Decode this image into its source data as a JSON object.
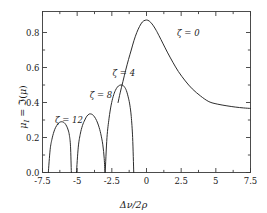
{
  "chart_data": {
    "type": "line",
    "title": "",
    "xlabel": "Δν/2ρ",
    "ylabel": "μ_I = ℑ(μ)",
    "xlim": [
      -7.5,
      7.5
    ],
    "ylim": [
      0.0,
      0.92
    ],
    "grid": false,
    "legend_position": "inline-annotations",
    "xticks": [
      "-7.5",
      "-5",
      "-2.5",
      "0",
      "2.5",
      "5",
      "7.5"
    ],
    "xtick_values": [
      -7.5,
      -5,
      -2.5,
      0,
      2.5,
      5,
      7.5
    ],
    "yticks": [
      "0.0",
      "0.2",
      "0.4",
      "0.6",
      "0.8"
    ],
    "ytick_values": [
      0.0,
      0.2,
      0.4,
      0.6,
      0.8
    ],
    "minor_xtick_values": [
      -6.25,
      -3.75,
      -1.25,
      1.25,
      3.75,
      6.25
    ],
    "minor_ytick_values": [
      0.1,
      0.3,
      0.5,
      0.7
    ],
    "series": [
      {
        "name": "ζ = 0",
        "label": "ζ = 0",
        "label_x": 2.2,
        "label_y": 0.79,
        "peak_x": 0.1,
        "peak_y": 0.87,
        "x": [
          -2.05,
          -1.9,
          -1.7,
          -1.5,
          -1.3,
          -1.1,
          -0.9,
          -0.7,
          -0.5,
          -0.3,
          -0.1,
          0.1,
          0.3,
          0.5,
          0.7,
          0.9,
          1.2,
          1.5,
          1.9,
          2.3,
          2.8,
          3.3,
          3.9,
          4.5,
          5.1,
          5.8,
          6.4,
          7.0,
          7.5
        ],
        "y": [
          0.4,
          0.455,
          0.52,
          0.585,
          0.645,
          0.7,
          0.755,
          0.8,
          0.835,
          0.86,
          0.87,
          0.87,
          0.858,
          0.838,
          0.812,
          0.782,
          0.735,
          0.688,
          0.63,
          0.577,
          0.523,
          0.478,
          0.437,
          0.405,
          0.391,
          0.381,
          0.374,
          0.369,
          0.366
        ]
      },
      {
        "name": "ζ = 4",
        "label": "ζ = 4",
        "label_x": -2.45,
        "label_y": 0.565,
        "peak_x": -1.75,
        "peak_y": 0.5,
        "zero_left": -2.98,
        "zero_right": -0.92,
        "x": [
          -2.98,
          -2.85,
          -2.7,
          -2.55,
          -2.4,
          -2.25,
          -2.1,
          -1.95,
          -1.75,
          -1.6,
          -1.45,
          -1.3,
          -1.2,
          -1.1,
          -1.0,
          -0.92
        ],
        "y": [
          0.0,
          0.2,
          0.31,
          0.385,
          0.435,
          0.468,
          0.488,
          0.498,
          0.5,
          0.49,
          0.468,
          0.425,
          0.385,
          0.32,
          0.2,
          0.0
        ]
      },
      {
        "name": "ζ = 8",
        "label": "ζ = 8",
        "label_x": -4.1,
        "label_y": 0.435,
        "peak_x": -4.05,
        "peak_y": 0.335,
        "zero_left": -5.05,
        "zero_right": -3.0,
        "x": [
          -5.05,
          -4.92,
          -4.78,
          -4.62,
          -4.45,
          -4.3,
          -4.15,
          -4.05,
          -3.9,
          -3.75,
          -3.6,
          -3.45,
          -3.3,
          -3.15,
          -3.05,
          -3.0
        ],
        "y": [
          0.0,
          0.145,
          0.218,
          0.268,
          0.3,
          0.322,
          0.333,
          0.335,
          0.331,
          0.318,
          0.297,
          0.266,
          0.222,
          0.158,
          0.08,
          0.0
        ]
      },
      {
        "name": "ζ = 12",
        "label": "ζ = 12",
        "label_x": -6.6,
        "label_y": 0.295,
        "peak_x": -6.15,
        "peak_y": 0.29,
        "zero_left": -7.08,
        "zero_right": -5.42,
        "x": [
          -7.08,
          -6.95,
          -6.82,
          -6.68,
          -6.55,
          -6.4,
          -6.28,
          -6.15,
          -6.0,
          -5.88,
          -5.76,
          -5.65,
          -5.56,
          -5.48,
          -5.42
        ],
        "y": [
          0.0,
          0.13,
          0.19,
          0.232,
          0.258,
          0.277,
          0.286,
          0.29,
          0.288,
          0.28,
          0.265,
          0.243,
          0.212,
          0.15,
          0.0
        ]
      }
    ]
  },
  "axes": {
    "x_title": "Δν/2ρ",
    "y_title_mu": "μ",
    "y_title_sub": "I",
    "y_title_eq": " = ",
    "y_title_im": "ℑ",
    "y_title_open": "(",
    "y_title_arg": "μ",
    "y_title_close": ")"
  },
  "style": {
    "curve_color": "#222222",
    "axis_color": "#3a3a3a",
    "background": "#ffffff",
    "text_color": "#1a1a1a"
  }
}
